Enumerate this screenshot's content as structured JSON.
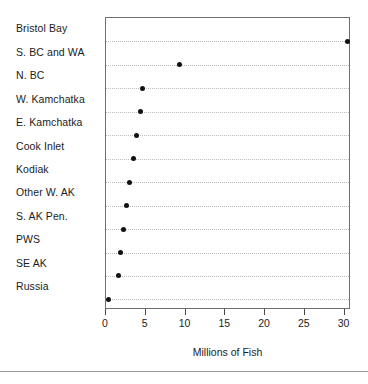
{
  "chart_data": {
    "type": "scatter",
    "plot_style": "cleveland-dot-plot",
    "title": "",
    "subtitle": "",
    "xlabel": "Millions of Fish",
    "ylabel": "",
    "xlim": [
      0,
      30.8
    ],
    "xticks": [
      0,
      5,
      10,
      15,
      20,
      25,
      30
    ],
    "xticklabels": [
      "0",
      "5",
      "10",
      "15",
      "20",
      "25",
      "30"
    ],
    "grid": "horizontal-dotted",
    "legend": "none",
    "marker": "filled-circle",
    "marker_color": "#111111",
    "categories": [
      "Bristol Bay",
      "S. BC and WA",
      "N. BC",
      "W. Kamchatka",
      "E. Kamchatka",
      "Cook Inlet",
      "Kodiak",
      "Other W. AK",
      "S. AK Pen.",
      "PWS",
      "SE AK",
      "Russia"
    ],
    "values": [
      30.4,
      9.2,
      4.6,
      4.3,
      3.8,
      3.4,
      3.0,
      2.6,
      2.2,
      1.8,
      1.6,
      0.3
    ],
    "points": [
      {
        "category": "Bristol Bay",
        "value": 30.4
      },
      {
        "category": "S. BC and WA",
        "value": 9.2
      },
      {
        "category": "N. BC",
        "value": 4.6
      },
      {
        "category": "W. Kamchatka",
        "value": 4.3
      },
      {
        "category": "E. Kamchatka",
        "value": 3.8
      },
      {
        "category": "Cook Inlet",
        "value": 3.4
      },
      {
        "category": "Kodiak",
        "value": 3.0
      },
      {
        "category": "Other W. AK",
        "value": 2.6
      },
      {
        "category": "S. AK Pen.",
        "value": 2.2
      },
      {
        "category": "PWS",
        "value": 1.8
      },
      {
        "category": "SE AK",
        "value": 1.6
      },
      {
        "category": "Russia",
        "value": 0.3
      }
    ]
  },
  "colors": {
    "frame": "#6e6e6e",
    "gridline": "#b9b9b9",
    "marker": "#111111",
    "text": "#1c1c1c",
    "rule": "#9a9a9a",
    "background": "#ffffff"
  }
}
